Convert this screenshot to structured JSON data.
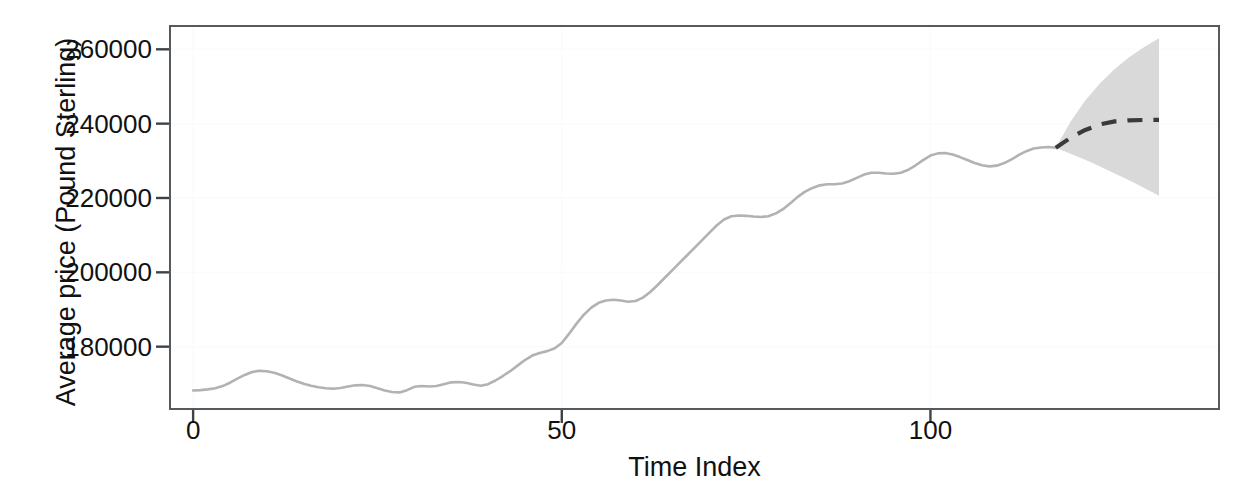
{
  "chart_data": {
    "type": "line",
    "title": "",
    "xlabel": "Time Index",
    "ylabel": "Average price (Pound Sterling)",
    "xlim": [
      -3,
      139
    ],
    "ylim": [
      163500,
      266000
    ],
    "xticks": [
      0,
      50,
      100
    ],
    "xtick_labels": [
      "0",
      "50",
      "100"
    ],
    "yticks": [
      180000,
      200000,
      220000,
      240000,
      260000
    ],
    "ytick_labels": [
      "180000",
      "200000",
      "220000",
      "240000",
      "260000"
    ],
    "grid": "faint",
    "legend": "none",
    "series": [
      {
        "name": "observed",
        "style": "solid",
        "color": "#b2b2b2",
        "x": [
          0,
          1,
          2,
          3,
          4,
          5,
          6,
          7,
          8,
          9,
          10,
          11,
          12,
          13,
          14,
          15,
          16,
          17,
          18,
          19,
          20,
          21,
          22,
          23,
          24,
          25,
          26,
          27,
          28,
          29,
          30,
          31,
          32,
          33,
          34,
          35,
          36,
          37,
          38,
          39,
          40,
          41,
          42,
          43,
          44,
          45,
          46,
          47,
          48,
          49,
          50,
          51,
          52,
          53,
          54,
          55,
          56,
          57,
          58,
          59,
          60,
          61,
          62,
          63,
          64,
          65,
          66,
          67,
          68,
          69,
          70,
          71,
          72,
          73,
          74,
          75,
          76,
          77,
          78,
          79,
          80,
          81,
          82,
          83,
          84,
          85,
          86,
          87,
          88,
          89,
          90,
          91,
          92,
          93,
          94,
          95,
          96,
          97,
          98,
          99,
          100,
          101,
          102,
          103,
          104,
          105,
          106,
          107,
          108,
          109,
          110,
          111,
          112,
          113,
          114,
          115,
          116,
          117
        ],
        "y": [
          168200,
          168300,
          168500,
          168800,
          169400,
          170300,
          171400,
          172400,
          173200,
          173500,
          173400,
          173000,
          172300,
          171500,
          170700,
          170000,
          169500,
          169100,
          168800,
          168700,
          168900,
          169300,
          169600,
          169700,
          169400,
          168800,
          168200,
          167800,
          167700,
          168300,
          169200,
          169400,
          169300,
          169400,
          169900,
          170400,
          170500,
          170300,
          169800,
          169500,
          169900,
          170900,
          172100,
          173400,
          174900,
          176400,
          177600,
          178300,
          178800,
          179500,
          181000,
          183500,
          186200,
          188600,
          190500,
          191800,
          192400,
          192600,
          192400,
          192100,
          192300,
          193200,
          194700,
          196600,
          198600,
          200600,
          202600,
          204600,
          206600,
          208600,
          210600,
          212600,
          214200,
          215100,
          215300,
          215200,
          215000,
          214900,
          215100,
          215800,
          217000,
          218600,
          220300,
          221700,
          222700,
          223400,
          223700,
          223700,
          223900,
          224500,
          225400,
          226300,
          226800,
          226800,
          226600,
          226500,
          226800,
          227600,
          228800,
          230200,
          231400,
          232000,
          232100,
          231700,
          231000,
          230200,
          229400,
          228800,
          228500,
          228700,
          229400,
          230400,
          231600,
          232600,
          233300,
          233600,
          233700,
          233500
        ]
      },
      {
        "name": "forecast",
        "style": "dashed",
        "color": "#3a3a3a",
        "x": [
          117,
          119,
          121,
          123,
          125,
          127,
          129,
          131
        ],
        "y": [
          233500,
          236200,
          238300,
          239800,
          240600,
          240900,
          241000,
          241000
        ]
      }
    ],
    "confidence_band": {
      "name": "forecast-interval",
      "color": "#d9d9d9",
      "x": [
        117,
        119,
        121,
        123,
        125,
        127,
        129,
        131
      ],
      "upper": [
        233500,
        240500,
        246200,
        250900,
        254700,
        257900,
        260600,
        263000
      ],
      "lower": [
        233500,
        231900,
        230300,
        228500,
        226600,
        224700,
        222700,
        220600
      ]
    }
  }
}
